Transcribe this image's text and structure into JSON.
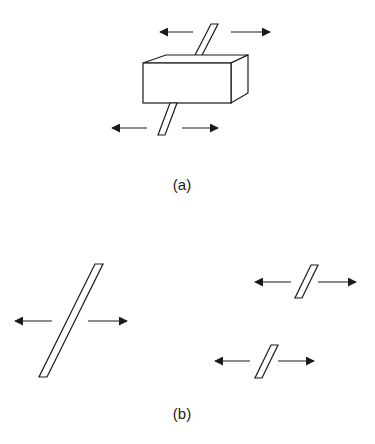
{
  "figure": {
    "panel_a": {
      "label": "(a)",
      "description": "Rod passing through a rectangular box, with opposing horizontal arrows above and below"
    },
    "panel_b": {
      "label": "(b)",
      "description": "Long slanted rod and two short slanted rods, each with opposing horizontal arrows"
    },
    "colors": {
      "stroke": "#1a1a1a",
      "background": "#ffffff"
    }
  }
}
